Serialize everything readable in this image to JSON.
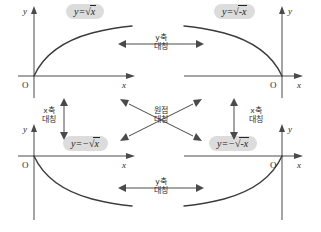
{
  "diagram": {
    "background_color": "#ffffff",
    "pill_color": "#dcdcdc",
    "curve_color": "#3c3c3c",
    "axis_color": "#4a4a4a"
  },
  "panels": [
    {
      "id": "top-left",
      "equation_plain": "y=√x",
      "equation": {
        "lhs": "y=",
        "radicand": "x",
        "sign": ""
      },
      "axis_x_label": "x",
      "axis_y_label": "y",
      "origin_label": "O",
      "quadrant": "I",
      "curve_description": "increasing concave-down from origin to upper right"
    },
    {
      "id": "top-right",
      "equation_plain": "y=√(-x)",
      "equation": {
        "lhs": "y=",
        "radicand": "-x",
        "sign": ""
      },
      "axis_x_label": "x",
      "axis_y_label": "y",
      "origin_label": "O",
      "quadrant": "II",
      "curve_description": "decreasing concave-down from upper left to origin"
    },
    {
      "id": "bottom-left",
      "equation_plain": "y=-√x",
      "equation": {
        "lhs": "y=−",
        "radicand": "x",
        "sign": "−"
      },
      "axis_x_label": "x",
      "axis_y_label": "y",
      "origin_label": "O",
      "quadrant": "IV",
      "curve_description": "decreasing concave-up from origin to lower right"
    },
    {
      "id": "bottom-right",
      "equation_plain": "y=-√(-x)",
      "equation": {
        "lhs": "y=−",
        "radicand": "-x",
        "sign": "−"
      },
      "axis_x_label": "x",
      "axis_y_label": "y",
      "origin_label": "O",
      "quadrant": "III",
      "curve_description": "increasing concave-down from lower left to origin"
    }
  ],
  "symmetries": [
    {
      "id": "top",
      "line1": "y축",
      "line2": "대칭",
      "meaning": "y-axis symmetry",
      "arrow": "horizontal-double"
    },
    {
      "id": "bottom",
      "line1": "y축",
      "line2": "대칭",
      "meaning": "y-axis symmetry",
      "arrow": "horizontal-double"
    },
    {
      "id": "left",
      "line1": "x축",
      "line2": "대칭",
      "meaning": "x-axis symmetry",
      "arrow": "vertical-double"
    },
    {
      "id": "right",
      "line1": "x축",
      "line2": "대칭",
      "meaning": "x-axis symmetry",
      "arrow": "vertical-double"
    },
    {
      "id": "center",
      "line1": "원점",
      "line2": "대칭",
      "meaning": "origin symmetry",
      "arrow": "diagonal-cross-double"
    }
  ]
}
